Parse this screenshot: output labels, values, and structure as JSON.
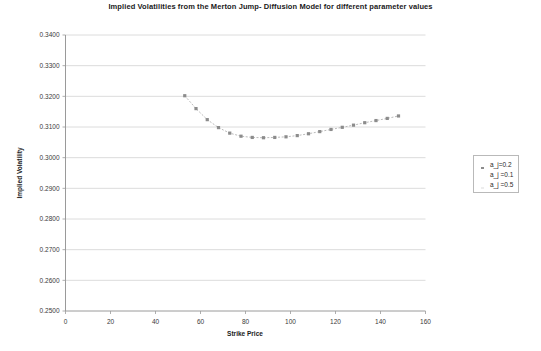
{
  "chart_data": {
    "type": "line",
    "title": "Implied Volatilities from the Merton Jump- Diffusion Model for different parameter values",
    "xlabel": "Strike Price",
    "ylabel": "Implied Volatility",
    "xlim": [
      0,
      160
    ],
    "ylim": [
      0.25,
      0.34
    ],
    "xticks": [
      0,
      20,
      40,
      60,
      80,
      100,
      120,
      140,
      160
    ],
    "xtick_labels": [
      "0",
      "20",
      "40",
      "60",
      "80",
      "100",
      "120",
      "140",
      "160"
    ],
    "yticks": [
      0.25,
      0.26,
      0.27,
      0.28,
      0.29,
      0.3,
      0.31,
      0.32,
      0.33,
      0.34
    ],
    "ytick_labels": [
      "0.2500",
      "0.2600",
      "0.2700",
      "0.2800",
      "0.2900",
      "0.3000",
      "0.3100",
      "0.3200",
      "0.3300",
      "0.3400"
    ],
    "grid": "horizontal",
    "legend_position": "right",
    "series": [
      {
        "name": "a_j=0.2",
        "marker": "square",
        "color": "#8c8c8c",
        "line_color": "#a8a8a8",
        "x": [
          53,
          58,
          63,
          68,
          73,
          78,
          83,
          88,
          93,
          98,
          103,
          108,
          113,
          118,
          123,
          128,
          133,
          138,
          143,
          148
        ],
        "y": [
          0.3202,
          0.316,
          0.3124,
          0.3098,
          0.308,
          0.307,
          0.3066,
          0.3065,
          0.3066,
          0.3068,
          0.3072,
          0.3078,
          0.3085,
          0.3092,
          0.3099,
          0.3106,
          0.3114,
          0.3121,
          0.3128,
          0.3136
        ]
      },
      {
        "name": "a_j =0.1",
        "marker": "none",
        "color": "#c9c9c9",
        "line_color": "#d0d0d0",
        "x": [],
        "y": []
      },
      {
        "name": "a_j =0.5",
        "marker": "none",
        "color": "#dcdcdc",
        "line_color": "#e0e0e0",
        "x": [],
        "y": []
      }
    ]
  },
  "legend": {
    "entries": [
      {
        "label": "a_j=0.2",
        "swatch": "#8c8c8c",
        "marker": "square"
      },
      {
        "label": "a_j =0.1",
        "swatch": "#ffffff",
        "marker": "none"
      },
      {
        "label": "a_j =0.5",
        "swatch": "#ededed",
        "marker": "none"
      }
    ]
  }
}
